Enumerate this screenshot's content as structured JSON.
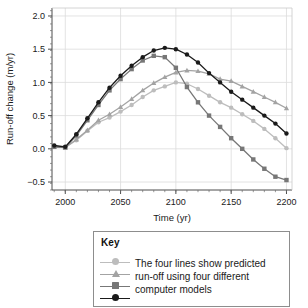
{
  "chart_data": {
    "type": "line",
    "title": "",
    "xlabel": "Time (yr)",
    "ylabel": "Run-off change (m/yr)",
    "xlim": [
      1988,
      2205
    ],
    "ylim": [
      -0.62,
      2.12
    ],
    "xticks": [
      2000,
      2050,
      2100,
      2150,
      2200
    ],
    "xtick_labels": [
      "2000",
      "2050",
      "2100",
      "2150",
      "2200"
    ],
    "yticks": [
      -0.5,
      0.0,
      0.5,
      1.0,
      1.5,
      2.0
    ],
    "ytick_labels": [
      "−0.5",
      "0.0",
      "0.5",
      "1.0",
      "1.5",
      "2.0"
    ],
    "grid": true,
    "grid_color": "#dcdcdc",
    "minor_ticks": true,
    "legend_position": "below-plot",
    "x": [
      1990,
      2000,
      2010,
      2020,
      2030,
      2040,
      2050,
      2060,
      2070,
      2080,
      2090,
      2100,
      2110,
      2120,
      2130,
      2140,
      2150,
      2160,
      2170,
      2180,
      2190,
      2200
    ],
    "series": [
      {
        "name": "model-1",
        "marker": "circle",
        "color": "#bdbdbd",
        "values": [
          0.03,
          0.02,
          0.13,
          0.27,
          0.4,
          0.47,
          0.56,
          0.66,
          0.78,
          0.88,
          0.94,
          1.0,
          0.98,
          0.9,
          0.8,
          0.7,
          0.62,
          0.52,
          0.42,
          0.3,
          0.16,
          0.01
        ]
      },
      {
        "name": "model-2",
        "marker": "triangle",
        "color": "#a3a3a3",
        "values": [
          0.03,
          0.02,
          0.14,
          0.28,
          0.43,
          0.52,
          0.63,
          0.75,
          0.88,
          0.99,
          1.08,
          1.15,
          1.18,
          1.17,
          1.13,
          1.05,
          1.02,
          0.94,
          0.86,
          0.78,
          0.7,
          0.61
        ]
      },
      {
        "name": "model-3",
        "marker": "square",
        "color": "#777777",
        "values": [
          0.03,
          0.02,
          0.2,
          0.43,
          0.66,
          0.88,
          1.05,
          1.2,
          1.33,
          1.4,
          1.38,
          1.22,
          0.93,
          0.7,
          0.5,
          0.33,
          0.16,
          0.0,
          -0.16,
          -0.3,
          -0.42,
          -0.47
        ]
      },
      {
        "name": "model-4",
        "marker": "circle",
        "color": "#1a1a1a",
        "values": [
          0.05,
          0.03,
          0.22,
          0.46,
          0.7,
          0.92,
          1.1,
          1.25,
          1.38,
          1.48,
          1.52,
          1.5,
          1.42,
          1.3,
          1.14,
          1.0,
          0.86,
          0.74,
          0.62,
          0.5,
          0.38,
          0.23
        ]
      }
    ]
  },
  "key": {
    "title": "Key",
    "lines": [
      "The four lines show predicted",
      "run-off using four different",
      "computer models"
    ],
    "samples": [
      {
        "name": "model-1-sample",
        "marker": "circle",
        "color": "#bdbdbd"
      },
      {
        "name": "model-2-sample",
        "marker": "triangle",
        "color": "#a3a3a3"
      },
      {
        "name": "model-3-sample",
        "marker": "square",
        "color": "#777777"
      },
      {
        "name": "model-4-sample",
        "marker": "circle",
        "color": "#1a1a1a"
      }
    ]
  }
}
